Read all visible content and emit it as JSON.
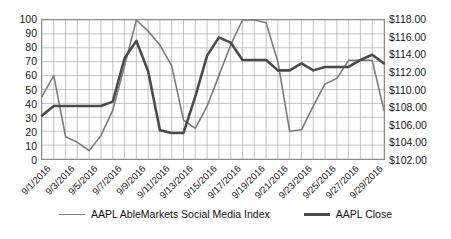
{
  "chart_data": {
    "type": "line",
    "title": "",
    "xlabel": "",
    "ylabel": "",
    "grid": true,
    "legend_position": "bottom",
    "x": [
      "9/1/2016",
      "9/2/2016",
      "9/3/2016",
      "9/4/2016",
      "9/5/2016",
      "9/6/2016",
      "9/7/2016",
      "9/8/2016",
      "9/9/2016",
      "9/10/2016",
      "9/11/2016",
      "9/12/2016",
      "9/13/2016",
      "9/14/2016",
      "9/15/2016",
      "9/16/2016",
      "9/17/2016",
      "9/18/2016",
      "9/19/2016",
      "9/20/2016",
      "9/21/2016",
      "9/22/2016",
      "9/23/2016",
      "9/24/2016",
      "9/25/2016",
      "9/26/2016",
      "9/27/2016",
      "9/28/2016",
      "9/29/2016",
      "9/30/2016"
    ],
    "x_tick_labels": [
      "9/1/2016",
      "9/3/2016",
      "9/5/2016",
      "9/7/2016",
      "9/9/2016",
      "9/11/2016",
      "9/13/2016",
      "9/15/2016",
      "9/17/2016",
      "9/19/2016",
      "9/21/2016",
      "9/23/2016",
      "9/25/2016",
      "9/27/2016",
      "9/29/2016"
    ],
    "axes": {
      "left": {
        "label": "",
        "min": 0,
        "max": 100,
        "ticks": [
          100,
          90,
          80,
          70,
          60,
          50,
          40,
          30,
          20,
          10,
          0
        ],
        "tick_labels": [
          "100",
          "90",
          "80",
          "70",
          "60",
          "50",
          "40",
          "30",
          "20",
          "10",
          "0"
        ]
      },
      "right": {
        "label": "",
        "min": 102,
        "max": 118,
        "ticks": [
          118,
          116,
          114,
          112,
          110,
          108,
          106,
          104,
          102
        ],
        "tick_labels": [
          "$118.00",
          "$116.00",
          "$114.00",
          "$112.00",
          "$110.00",
          "$108.00",
          "$106.00",
          "$104.00",
          "$102.00"
        ]
      }
    },
    "series": [
      {
        "name": "AAPL AbleMarkets Social Media Index",
        "axis": "left",
        "color": "#7b7b7b",
        "width": 1.6,
        "values": [
          45,
          60,
          16,
          12,
          6,
          17,
          35,
          67,
          100,
          92,
          82,
          67,
          28,
          22,
          38,
          60,
          82,
          100,
          100,
          98,
          70,
          20,
          21,
          38,
          54,
          58,
          71,
          71,
          71,
          35
        ]
      },
      {
        "name": "AAPL Close",
        "axis": "right",
        "color": "#4a4a4a",
        "width": 2.6,
        "values": [
          107.0,
          108.1,
          108.1,
          108.1,
          108.1,
          108.1,
          108.6,
          113.6,
          115.6,
          112.1,
          105.3,
          105.0,
          105.0,
          109.2,
          113.9,
          116.0,
          115.4,
          113.4,
          113.4,
          113.4,
          112.2,
          112.2,
          113.0,
          112.2,
          112.6,
          112.6,
          112.6,
          113.4,
          114.0,
          113.0
        ]
      }
    ],
    "series2_tail": {
      "note": "additional AAPL Close segment values rendered in right-hand region",
      "values": [
        112.2,
        117.9,
        113.6,
        114.2,
        115.3,
        112.3,
        113.0,
        113.3,
        113.4,
        113.9,
        117.9,
        112.6,
        113.0,
        110.9
      ]
    },
    "index_tail": {
      "note": "additional social media index segment values in right-hand region",
      "values": [
        34,
        78,
        81,
        66,
        65,
        65,
        16,
        14,
        60,
        58,
        60,
        73,
        64,
        67
      ]
    }
  },
  "legend": {
    "items": [
      {
        "label": "AAPL AbleMarkets Social Media Index",
        "style": "thin"
      },
      {
        "label": "AAPL Close",
        "style": "thick"
      }
    ]
  }
}
